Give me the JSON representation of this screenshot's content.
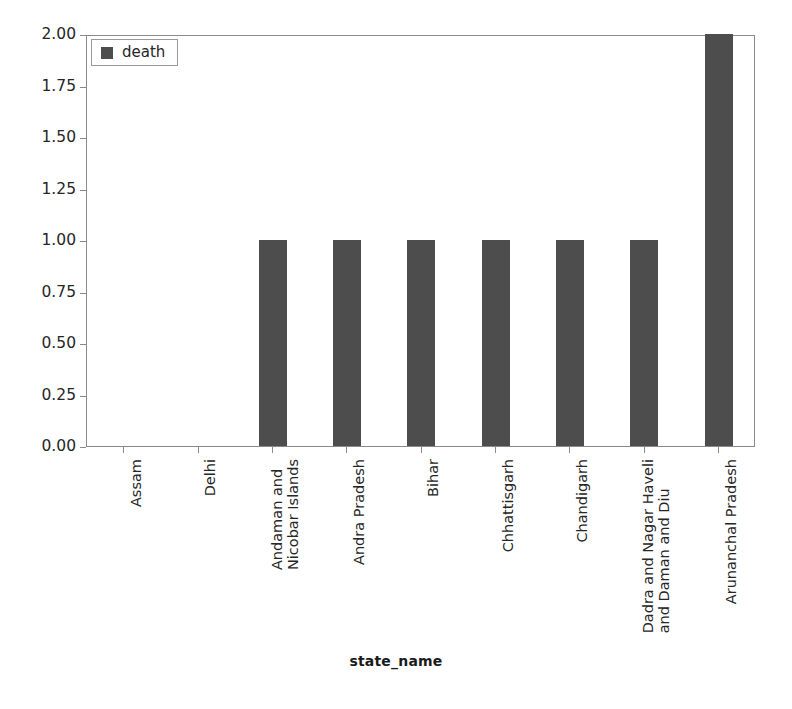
{
  "chart_data": {
    "type": "bar",
    "title": "",
    "subtitle": "",
    "xlabel": "state_name",
    "ylabel": "",
    "categories": [
      "Assam",
      "Delhi",
      "Andaman and Nicobar Islands",
      "Andra Pradesh",
      "Bihar",
      "Chhattisgarh",
      "Chandigarh",
      "Dadra and Nagar Haveli and Daman and Diu",
      "Arunanchal Pradesh"
    ],
    "category_label_lines": [
      [
        "Assam"
      ],
      [
        "Delhi"
      ],
      [
        "Andaman and",
        "Nicobar Islands"
      ],
      [
        "Andra Pradesh"
      ],
      [
        "Bihar"
      ],
      [
        "Chhattisgarh"
      ],
      [
        "Chandigarh"
      ],
      [
        "Dadra and Nagar Haveli",
        "and Daman and Diu"
      ],
      [
        "Arunanchal Pradesh"
      ]
    ],
    "series": [
      {
        "name": "death",
        "values": [
          0,
          0,
          1,
          1,
          1,
          1,
          1,
          1,
          2
        ],
        "color": "#4d4d4d"
      }
    ],
    "values": [
      0,
      0,
      1,
      1,
      1,
      1,
      1,
      1,
      2
    ],
    "ylim": [
      0.0,
      2.0
    ],
    "yticks": [
      0.0,
      0.25,
      0.5,
      0.75,
      1.0,
      1.25,
      1.5,
      1.75,
      2.0
    ],
    "ytick_labels": [
      "0.00",
      "0.25",
      "0.50",
      "0.75",
      "1.00",
      "1.25",
      "1.50",
      "1.75",
      "2.00"
    ],
    "grid": false,
    "legend": {
      "position": "upper left",
      "entries": [
        {
          "label": "death",
          "color": "#4d4d4d"
        }
      ]
    },
    "xtick_rotation": 90,
    "bar_color": "#4d4d4d",
    "axes_color": "#8a8a8a",
    "background": "#ffffff"
  }
}
